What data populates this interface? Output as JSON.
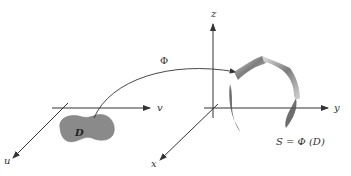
{
  "diagram": {
    "left_axes": {
      "u_label": "u",
      "v_label": "v"
    },
    "region_label": "D",
    "map_label": "Φ",
    "right_axes": {
      "x_label": "x",
      "y_label": "y",
      "z_label": "z"
    },
    "surface_label": "S = Φ (D)",
    "colors": {
      "axis": "#333333",
      "region": "#8a8a8a",
      "surface": "#777777",
      "background": "#ffffff"
    }
  }
}
